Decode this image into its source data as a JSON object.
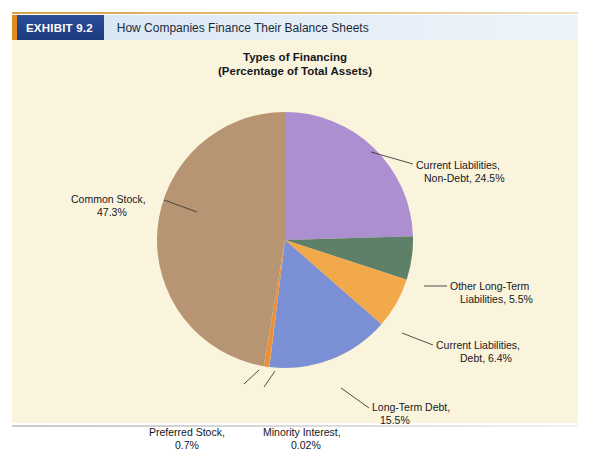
{
  "exhibit": {
    "badge_label": "EXHIBIT 9.2",
    "title": "How Companies Finance Their Balance Sheets"
  },
  "chart_title": {
    "line1": "Types of Financing",
    "line2": "(Percentage of Total Assets)"
  },
  "labels": {
    "current_liabilities_nondebt": {
      "line1": "Current Liabilities,",
      "line2": "Non-Debt, 24.5%"
    },
    "other_long_term_liabilities": {
      "line1": "Other Long-Term",
      "line2": "Liabilities, 5.5%"
    },
    "current_liabilities_debt": {
      "line1": "Current Liabilities,",
      "line2": "Debt, 6.4%"
    },
    "long_term_debt": {
      "line1": "Long-Term Debt,",
      "line2": "15.5%"
    },
    "minority_interest": {
      "line1": "Minority Interest,",
      "line2": "0.02%"
    },
    "preferred_stock": {
      "line1": "Preferred Stock,",
      "line2": "0.7%"
    },
    "common_stock": {
      "line1": "Common Stock,",
      "line2": "47.3%"
    }
  },
  "colors": {
    "panel_background": "#fbf4dc",
    "badge_navy": "#1f3a7a",
    "badge_accent_orange": "#e08a20",
    "title_bar_blue": "#d9e6f4",
    "current_liabilities_nondebt": "#ab8fd1",
    "other_long_term_liabilities": "#5f8068",
    "current_liabilities_debt": "#f2a94a",
    "long_term_debt": "#7b8fd4",
    "minority_interest": "#f5d21e",
    "preferred_stock": "#e8903a",
    "common_stock": "#b79472"
  },
  "chart_data": {
    "type": "pie",
    "title": "Types of Financing (Percentage of Total Assets)",
    "unit": "percent",
    "legend": "labels-with-leader-lines",
    "total": 99.92,
    "categories": [
      "Current Liabilities, Non-Debt",
      "Other Long-Term Liabilities",
      "Current Liabilities, Debt",
      "Long-Term Debt",
      "Minority Interest",
      "Preferred Stock",
      "Common Stock"
    ],
    "values": [
      24.5,
      5.5,
      6.4,
      15.5,
      0.02,
      0.7,
      47.3
    ],
    "slice_colors": [
      "#ab8fd1",
      "#5f8068",
      "#f2a94a",
      "#7b8fd4",
      "#f5d21e",
      "#e8903a",
      "#b79472"
    ],
    "start_angle_deg": 0,
    "direction": "clockwise"
  }
}
